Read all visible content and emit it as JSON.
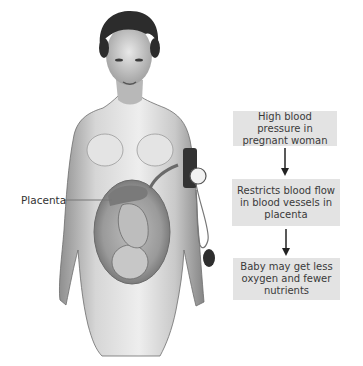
{
  "figure": {
    "label": "Placenta"
  },
  "flow": {
    "steps": [
      {
        "text": "High blood pressure in pregnant woman"
      },
      {
        "text": "Restricts blood flow in blood vessels in placenta"
      },
      {
        "text": "Baby may get less oxygen and fewer nutrients"
      }
    ],
    "box_color": "#e3e3e3",
    "text_color": "#3a3a3a"
  }
}
